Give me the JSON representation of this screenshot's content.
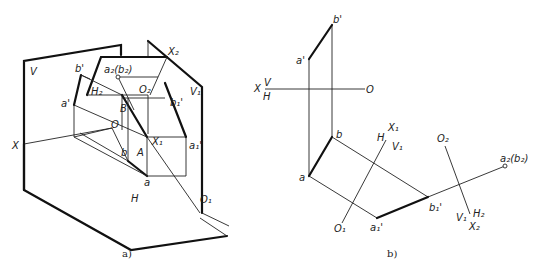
{
  "figure": {
    "captions": {
      "a": "a)",
      "b": "b)"
    }
  },
  "panel_a": {
    "labels": {
      "V": "V",
      "H": "H",
      "X": "X",
      "O": "O",
      "b_prime": "b'",
      "a_prime": "a'",
      "a2b2": "a₂(b₂)",
      "H2": "H₂",
      "O2": "O₂",
      "X2": "X₂",
      "V1": "V₁",
      "b1_prime": "b₁'",
      "B": "B",
      "A": "A",
      "X1": "X₁",
      "a1_prime": "a₁'",
      "b": "b",
      "a": "a",
      "O1": "O₁"
    }
  },
  "panel_b": {
    "labels": {
      "b_prime": "b'",
      "a_prime": "a'",
      "X": "X",
      "V": "V",
      "H": "H",
      "O": "O",
      "b": "b",
      "a": "a",
      "X1": "X₁",
      "H_axis1": "H",
      "V1": "V₁",
      "O1": "O₁",
      "a1_prime": "a₁'",
      "b1_prime": "b₁'",
      "O2": "O₂",
      "a2b2": "a₂(b₂)",
      "V1_axis2": "V₁",
      "H2": "H₂",
      "X2": "X₂"
    }
  }
}
